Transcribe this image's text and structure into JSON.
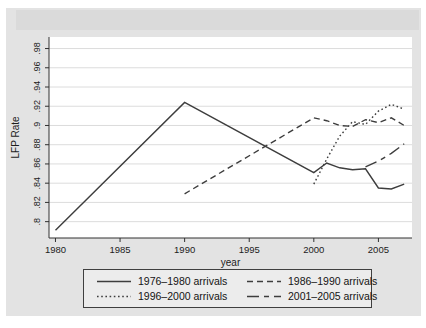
{
  "figure": {
    "background": "#e3e3e3",
    "top_shade": "#dadada",
    "plot_background": "#ffffff",
    "grid_color": "#dcdcdc",
    "axis_color": "#303030",
    "text_color": "#1c1c1c",
    "line_color": "#3d3d3d",
    "legend_background": "#ececec",
    "legend_border": "#3f3f3f"
  },
  "chart_data": {
    "type": "line",
    "title": "",
    "xlabel": "year",
    "ylabel": "LFP Rate",
    "xlim": [
      1979.5,
      2007.6
    ],
    "ylim": [
      0.783,
      0.992
    ],
    "grid": true,
    "legend_position": "bottom-center",
    "xticks": [
      1980,
      1985,
      1990,
      1995,
      2000,
      2005
    ],
    "xtick_labels": [
      "1980",
      "1985",
      "1990",
      "1995",
      "2000",
      "2005"
    ],
    "ytick_values": [
      0.8,
      0.82,
      0.84,
      0.86,
      0.88,
      0.9,
      0.92,
      0.94,
      0.96,
      0.98
    ],
    "ytick_labels": [
      ".8",
      ".82",
      ".84",
      ".86",
      ".88",
      ".9",
      ".92",
      ".94",
      ".96",
      ".98"
    ],
    "series": [
      {
        "name": "1976–1980 arrivals",
        "dash": "solid",
        "x": [
          1980,
          1990,
          2000,
          2001,
          2002,
          2003,
          2004,
          2005,
          2006,
          2007
        ],
        "y": [
          0.791,
          0.924,
          0.851,
          0.861,
          0.856,
          0.854,
          0.855,
          0.835,
          0.834,
          0.839
        ]
      },
      {
        "name": "1986–1990 arrivals",
        "dash": "dashed",
        "x": [
          1990,
          2000,
          2001,
          2002,
          2003,
          2004,
          2005,
          2006,
          2007
        ],
        "y": [
          0.829,
          0.908,
          0.905,
          0.9,
          0.899,
          0.906,
          0.903,
          0.908,
          0.9
        ]
      },
      {
        "name": "1996–2000 arrivals",
        "dash": "dotted",
        "x": [
          2000,
          2001,
          2002,
          2003,
          2004,
          2005,
          2006,
          2007
        ],
        "y": [
          0.839,
          0.865,
          0.889,
          0.904,
          0.901,
          0.915,
          0.922,
          0.917
        ]
      },
      {
        "name": "2001–2005 arrivals",
        "dash": "longdash-shortdash",
        "x": [
          2004,
          2005,
          2006,
          2007
        ],
        "y": [
          0.857,
          0.863,
          0.871,
          0.881
        ]
      }
    ]
  }
}
